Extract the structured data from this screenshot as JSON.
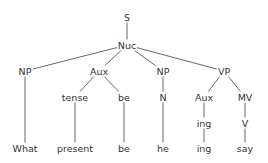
{
  "diagram": {
    "type": "syntax-tree",
    "nodes": [
      {
        "id": "S",
        "label": "S",
        "x": 127,
        "y": 17
      },
      {
        "id": "Nuc",
        "label": "Nuc",
        "x": 127,
        "y": 45
      },
      {
        "id": "NP1",
        "label": "NP",
        "x": 25,
        "y": 71
      },
      {
        "id": "Aux1",
        "label": "Aux",
        "x": 99,
        "y": 71
      },
      {
        "id": "NP2",
        "label": "NP",
        "x": 163,
        "y": 71
      },
      {
        "id": "VP",
        "label": "VP",
        "x": 224,
        "y": 71
      },
      {
        "id": "tense",
        "label": "tense",
        "x": 75,
        "y": 97
      },
      {
        "id": "be1",
        "label": "be",
        "x": 124,
        "y": 97
      },
      {
        "id": "N",
        "label": "N",
        "x": 163,
        "y": 97
      },
      {
        "id": "Aux2",
        "label": "Aux",
        "x": 204,
        "y": 97
      },
      {
        "id": "MV",
        "label": "MV",
        "x": 245,
        "y": 97
      },
      {
        "id": "ing1",
        "label": "ing",
        "x": 204,
        "y": 123
      },
      {
        "id": "V",
        "label": "V",
        "x": 245,
        "y": 123
      },
      {
        "id": "what",
        "label": "What",
        "x": 25,
        "y": 148
      },
      {
        "id": "present",
        "label": "present",
        "x": 75,
        "y": 148
      },
      {
        "id": "be2",
        "label": "be",
        "x": 124,
        "y": 148
      },
      {
        "id": "he",
        "label": "he",
        "x": 163,
        "y": 148
      },
      {
        "id": "ing2",
        "label": "ing",
        "x": 204,
        "y": 148
      },
      {
        "id": "say",
        "label": "say",
        "x": 245,
        "y": 148
      }
    ],
    "edges": [
      [
        "S",
        "Nuc"
      ],
      [
        "Nuc",
        "NP1"
      ],
      [
        "Nuc",
        "Aux1"
      ],
      [
        "Nuc",
        "NP2"
      ],
      [
        "Nuc",
        "VP"
      ],
      [
        "NP1",
        "what"
      ],
      [
        "Aux1",
        "tense"
      ],
      [
        "Aux1",
        "be1"
      ],
      [
        "tense",
        "present"
      ],
      [
        "be1",
        "be2"
      ],
      [
        "NP2",
        "N"
      ],
      [
        "N",
        "he"
      ],
      [
        "VP",
        "Aux2"
      ],
      [
        "VP",
        "MV"
      ],
      [
        "Aux2",
        "ing1"
      ],
      [
        "ing1",
        "ing2"
      ],
      [
        "MV",
        "V"
      ],
      [
        "V",
        "say"
      ]
    ]
  }
}
